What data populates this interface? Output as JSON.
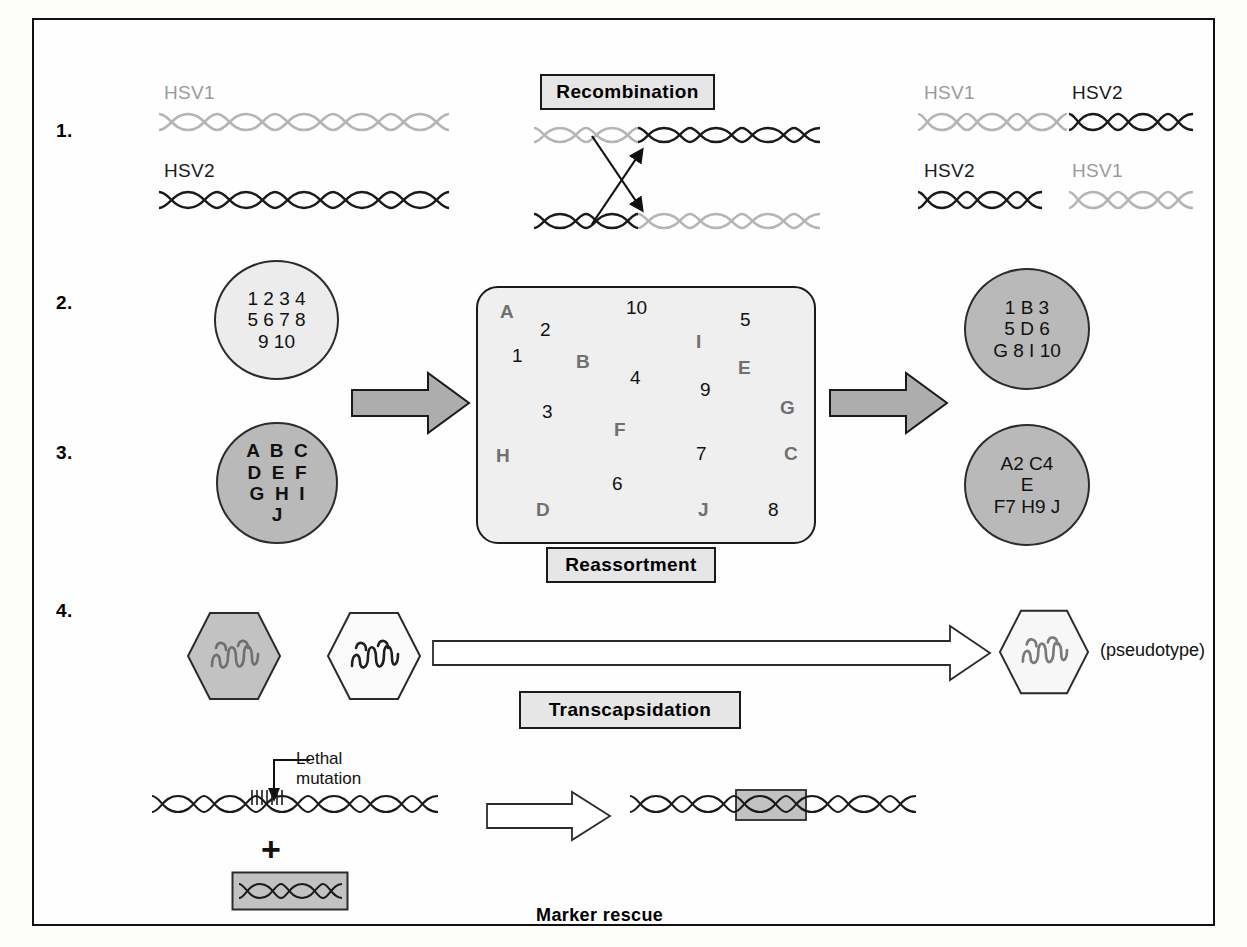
{
  "figure": {
    "steps": [
      "1.",
      "2.",
      "3.",
      "4."
    ]
  },
  "recombination": {
    "box_label": "Recombination",
    "input_labels": {
      "top": "HSV1",
      "bottom": "HSV2"
    },
    "output_labels": {
      "top_left": "HSV1",
      "top_right": "HSV2",
      "bottom_left": "HSV2",
      "bottom_right": "HSV1"
    }
  },
  "reassortment": {
    "box_label": "Reassortment",
    "input_circle_numbers": {
      "rows": [
        "1 2 3 4",
        "5 6 7 8",
        "9 10"
      ]
    },
    "input_circle_letters": {
      "rows": [
        "A  B  C",
        "D  E  F",
        "G  H  I",
        "J"
      ]
    },
    "pool": {
      "numbers": [
        "10",
        "2",
        "5",
        "1",
        "4",
        "9",
        "3",
        "6",
        "7",
        "8"
      ],
      "letters": [
        "A",
        "B",
        "I",
        "E",
        "G",
        "F",
        "C",
        "H",
        "D",
        "J"
      ]
    },
    "output_circle_top": {
      "rows": [
        "1 B 3",
        "5 D 6",
        "G 8 I 10"
      ]
    },
    "output_circle_bottom": {
      "rows": [
        "A2 C4",
        "E",
        "F7 H9 J"
      ]
    }
  },
  "transcapsidation": {
    "box_label": "Transcapsidation",
    "pseudotype_label": "(pseudotype)"
  },
  "marker_rescue": {
    "label": "Marker rescue",
    "lethal_mutation_line1": "Lethal",
    "lethal_mutation_line2": "mutation",
    "plus": "+"
  },
  "colors": {
    "hsv1_strand": "#b5b5b5",
    "hsv2_strand": "#1a1a1a",
    "box_fill": "#e6e6e6",
    "circle_light": "#ececec",
    "circle_dark": "#b9b9b9",
    "arrow_fill": "#adadad",
    "outline": "#1a1a1a"
  }
}
